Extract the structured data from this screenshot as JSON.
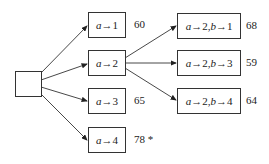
{
  "root": {
    "label": ""
  },
  "level1": [
    {
      "var": "a",
      "assign": " →1",
      "score": "60"
    },
    {
      "var": "a",
      "assign": " →2",
      "score": ""
    },
    {
      "var": "a",
      "assign": " →3",
      "score": "65"
    },
    {
      "var": "a",
      "assign": " →4",
      "score": "78 *"
    }
  ],
  "level2": [
    {
      "text_a": "a",
      "mid": " →2, ",
      "text_b": "b",
      "end": " →1",
      "score": "68"
    },
    {
      "text_a": "a",
      "mid": " →2, ",
      "text_b": "b",
      "end": " →3",
      "score": "59"
    },
    {
      "text_a": "a",
      "mid": " →2, ",
      "text_b": "b",
      "end": " →4",
      "score": "64"
    }
  ]
}
